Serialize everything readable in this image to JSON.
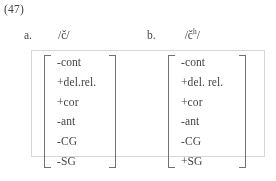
{
  "example": {
    "number": "(47)"
  },
  "columns": [
    {
      "item_label": "a.",
      "phoneme_open": "/",
      "phoneme_base": "č",
      "phoneme_sup": "",
      "phoneme_close": "/",
      "features": [
        "-cont",
        "+del.rel.",
        "+cor",
        "-ant",
        "-CG",
        "-SG"
      ]
    },
    {
      "item_label": "b.",
      "phoneme_open": "/",
      "phoneme_base": "č",
      "phoneme_sup": "h",
      "phoneme_close": "/",
      "features": [
        "-cont",
        "+del.  rel.",
        "+cor",
        "-ant",
        "-CG",
        "+SG"
      ]
    }
  ],
  "colors": {
    "text": "#3d3d3d",
    "bracket": "#6e6e6e",
    "scan_artifact_border": "#d8d8d8",
    "background": "#ffffff"
  }
}
